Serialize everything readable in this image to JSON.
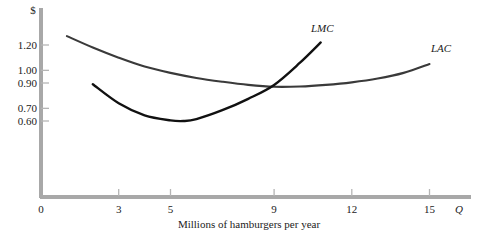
{
  "chart_data": {
    "type": "line",
    "title": "",
    "xlabel": "Millions of hamburgers per year",
    "ylabel": "$",
    "x_axis_symbol": "Q",
    "xlim": [
      0,
      16.5
    ],
    "ylim": [
      0,
      1.45
    ],
    "grid": false,
    "legend_position": "inline-curve-labels",
    "x_ticks": [
      "0",
      "3",
      "5",
      "9",
      "12",
      "15"
    ],
    "x_tick_values": [
      0,
      3,
      5,
      9,
      12,
      15
    ],
    "y_ticks": [
      "1.20",
      "1.00",
      "0.90",
      "0.70",
      "0.60"
    ],
    "y_tick_values": [
      1.2,
      1.0,
      0.9,
      0.7,
      0.6
    ],
    "series": [
      {
        "name": "LAC",
        "label": "LAC",
        "color": "#3a3a3a",
        "x": [
          1.0,
          2.0,
          3.0,
          4.0,
          5.0,
          6.0,
          7.0,
          8.0,
          9.0,
          10.0,
          11.0,
          12.0,
          13.0,
          14.0,
          15.0
        ],
        "values": [
          1.27,
          1.18,
          1.1,
          1.03,
          0.98,
          0.94,
          0.91,
          0.885,
          0.87,
          0.872,
          0.885,
          0.905,
          0.935,
          0.98,
          1.05
        ]
      },
      {
        "name": "LMC",
        "label": "LMC",
        "color": "#111111",
        "x": [
          2.0,
          3.0,
          4.0,
          5.0,
          5.5,
          6.0,
          7.0,
          8.0,
          9.0,
          10.0,
          10.8
        ],
        "values": [
          0.89,
          0.74,
          0.645,
          0.605,
          0.6,
          0.615,
          0.685,
          0.775,
          0.885,
          1.06,
          1.22
        ]
      }
    ],
    "annotations": [
      {
        "name": "intersection",
        "x": 9.0,
        "y": 0.87,
        "note": "LMC crosses LAC at LAC minimum"
      }
    ]
  },
  "labels": {
    "dollar_sign": "$",
    "x_axis_title": "Millions of hamburgers per year",
    "q_symbol": "Q",
    "lmc_label": "LMC",
    "lac_label": "LAC"
  },
  "colors": {
    "axis": "#a8a8a8",
    "lac_curve": "#3a3a3a",
    "lmc_curve": "#111111",
    "text": "#222222",
    "background": "#ffffff"
  }
}
